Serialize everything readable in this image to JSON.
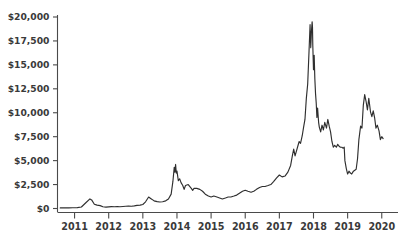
{
  "chart_data": {
    "type": "line",
    "title": "",
    "subtitle": "",
    "xlabel": "",
    "ylabel": "",
    "grid": false,
    "legend": false,
    "legend_position": "none",
    "line_color": "#2f2f2f",
    "axis_color": "#4a4a4a",
    "background_color": "#ffffff",
    "xlim": [
      2010.5,
      2020.3
    ],
    "ylim": [
      0,
      20000
    ],
    "y_ticks": [
      0,
      2500,
      5000,
      7500,
      10000,
      12500,
      15000,
      17500,
      20000
    ],
    "y_tick_labels": [
      "$0",
      "$2,500",
      "$5,000",
      "$7,500",
      "$10,000",
      "$12,500",
      "$15,000",
      "$17,500",
      "$20,000"
    ],
    "x_ticks": [
      2011,
      2012,
      2013,
      2014,
      2015,
      2016,
      2017,
      2018,
      2019,
      2020
    ],
    "x_tick_labels": [
      "2011",
      "2012",
      "2013",
      "2014",
      "2015",
      "2016",
      "2017",
      "2018",
      "2019",
      "2020"
    ],
    "series": [
      {
        "name": "Price",
        "x": [
          2010.58,
          2010.7,
          2010.83,
          2010.95,
          2011.08,
          2011.2,
          2011.33,
          2011.45,
          2011.5,
          2011.58,
          2011.66,
          2011.75,
          2011.83,
          2011.92,
          2012.0,
          2012.08,
          2012.17,
          2012.25,
          2012.33,
          2012.42,
          2012.5,
          2012.58,
          2012.67,
          2012.75,
          2012.83,
          2012.92,
          2013.0,
          2013.08,
          2013.17,
          2013.25,
          2013.29,
          2013.33,
          2013.42,
          2013.5,
          2013.58,
          2013.67,
          2013.75,
          2013.83,
          2013.88,
          2013.92,
          2013.94,
          2013.96,
          2013.98,
          2014.0,
          2014.02,
          2014.04,
          2014.06,
          2014.08,
          2014.12,
          2014.17,
          2014.21,
          2014.25,
          2014.33,
          2014.42,
          2014.46,
          2014.5,
          2014.58,
          2014.67,
          2014.75,
          2014.83,
          2014.92,
          2015.0,
          2015.08,
          2015.17,
          2015.25,
          2015.33,
          2015.42,
          2015.5,
          2015.58,
          2015.67,
          2015.75,
          2015.83,
          2015.92,
          2016.0,
          2016.08,
          2016.17,
          2016.25,
          2016.33,
          2016.42,
          2016.5,
          2016.58,
          2016.67,
          2016.75,
          2016.83,
          2016.92,
          2017.0,
          2017.08,
          2017.17,
          2017.25,
          2017.33,
          2017.38,
          2017.42,
          2017.46,
          2017.5,
          2017.54,
          2017.58,
          2017.62,
          2017.67,
          2017.71,
          2017.75,
          2017.79,
          2017.83,
          2017.87,
          2017.9,
          2017.92,
          2017.94,
          2017.96,
          2017.97,
          2017.98,
          2018.0,
          2018.02,
          2018.04,
          2018.06,
          2018.08,
          2018.1,
          2018.12,
          2018.15,
          2018.17,
          2018.21,
          2018.25,
          2018.29,
          2018.33,
          2018.38,
          2018.42,
          2018.46,
          2018.5,
          2018.54,
          2018.58,
          2018.62,
          2018.67,
          2018.71,
          2018.75,
          2018.79,
          2018.83,
          2018.87,
          2018.9,
          2018.92,
          2018.96,
          2019.0,
          2019.04,
          2019.08,
          2019.12,
          2019.17,
          2019.21,
          2019.25,
          2019.29,
          2019.33,
          2019.38,
          2019.42,
          2019.46,
          2019.5,
          2019.54,
          2019.58,
          2019.62,
          2019.67,
          2019.71,
          2019.75,
          2019.79,
          2019.83,
          2019.87,
          2019.92,
          2019.96,
          2020.0,
          2020.04
        ],
        "values": [
          60,
          60,
          70,
          80,
          90,
          160,
          600,
          1000,
          900,
          450,
          350,
          300,
          180,
          150,
          170,
          190,
          180,
          200,
          180,
          210,
          230,
          250,
          240,
          280,
          330,
          350,
          420,
          700,
          1200,
          1000,
          900,
          800,
          720,
          680,
          700,
          800,
          1000,
          1500,
          2800,
          4300,
          3800,
          4600,
          3700,
          3900,
          3400,
          2900,
          3000,
          3100,
          2700,
          2400,
          2000,
          2400,
          2500,
          2100,
          1900,
          2100,
          2100,
          2000,
          1800,
          1500,
          1300,
          1200,
          1300,
          1200,
          1100,
          1000,
          1100,
          1200,
          1200,
          1300,
          1400,
          1600,
          1800,
          1900,
          1800,
          1700,
          1800,
          2000,
          2200,
          2300,
          2300,
          2400,
          2500,
          2800,
          3200,
          3500,
          3300,
          3400,
          3800,
          4500,
          5500,
          6200,
          5500,
          6000,
          6500,
          7000,
          6800,
          7600,
          8500,
          9300,
          11500,
          13000,
          16500,
          19200,
          16800,
          18500,
          19500,
          19000,
          17000,
          14500,
          16000,
          13500,
          12000,
          11000,
          9500,
          10500,
          9000,
          8500,
          8000,
          8700,
          8200,
          9000,
          8400,
          9300,
          8600,
          8000,
          7000,
          6400,
          6600,
          6400,
          6700,
          6500,
          6400,
          6400,
          6300,
          6400,
          5000,
          4200,
          3600,
          3900,
          3700,
          3600,
          3900,
          4000,
          4100,
          5200,
          7200,
          8600,
          8400,
          10800,
          11900,
          11200,
          10300,
          11500,
          10100,
          9600,
          10200,
          9500,
          8400,
          8700,
          8100,
          7200,
          7500,
          7300
        ]
      }
    ]
  }
}
